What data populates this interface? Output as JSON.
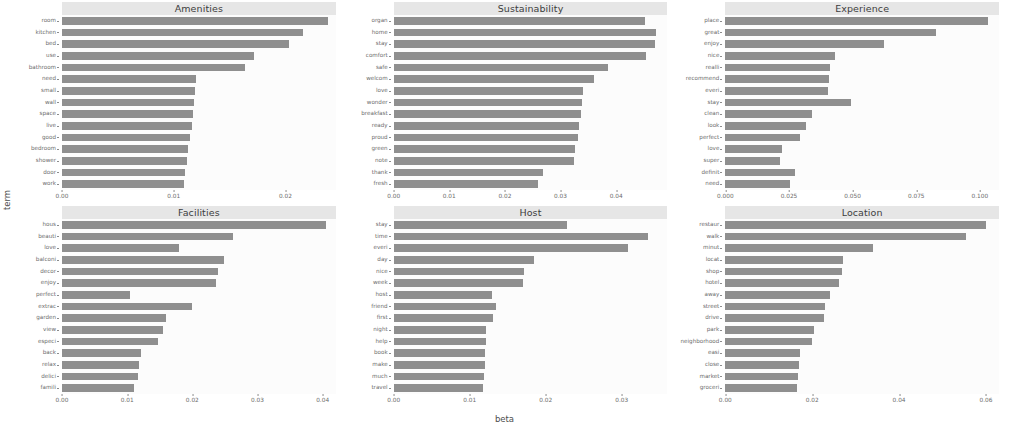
{
  "figure": {
    "xlabel": "beta",
    "ylabel": "term",
    "bar_color": "#8f8f8f",
    "strip_color": "#e6e6e6",
    "panel_color": "#fcfcfc"
  },
  "chart_data": [
    {
      "type": "bar",
      "title": "Amenities",
      "orientation": "horizontal",
      "xlabel": "beta",
      "ylabel": "term",
      "xlim": [
        0,
        0.0245
      ],
      "xticks": [
        0.0,
        0.01,
        0.02
      ],
      "xticklabels": [
        "0.00",
        "0.01",
        "0.02"
      ],
      "grid": false,
      "categories": [
        "room",
        "kitchen",
        "bed",
        "use",
        "bathroom",
        "need",
        "small",
        "wall",
        "space",
        "live",
        "good",
        "bedroom",
        "shower",
        "door",
        "work"
      ],
      "values": [
        0.0238,
        0.0216,
        0.0203,
        0.0172,
        0.0164,
        0.012,
        0.0119,
        0.0118,
        0.0117,
        0.0116,
        0.0115,
        0.0113,
        0.0112,
        0.011,
        0.0109
      ]
    },
    {
      "type": "bar",
      "title": "Sustainability",
      "orientation": "horizontal",
      "xlabel": "beta",
      "ylabel": "term",
      "xlim": [
        0,
        0.0492
      ],
      "xticks": [
        0.0,
        0.01,
        0.02,
        0.03,
        0.04
      ],
      "xticklabels": [
        "0.00",
        "0.01",
        "0.02",
        "0.03",
        "0.04"
      ],
      "grid": false,
      "categories": [
        "organ",
        "home",
        "stay",
        "comfort",
        "safe",
        "welcom",
        "love",
        "wonder",
        "breakfast",
        "ready",
        "proud",
        "green",
        "note",
        "thank",
        "fresh"
      ],
      "values": [
        0.0452,
        0.0472,
        0.047,
        0.0453,
        0.0386,
        0.0361,
        0.034,
        0.0338,
        0.0337,
        0.0334,
        0.0331,
        0.0326,
        0.0324,
        0.0268,
        0.026
      ]
    },
    {
      "type": "bar",
      "title": "Experience",
      "orientation": "horizontal",
      "xlabel": "beta",
      "ylabel": "term",
      "xlim": [
        0,
        0.1075
      ],
      "xticks": [
        0.0,
        0.025,
        0.05,
        0.075,
        0.1
      ],
      "xticklabels": [
        "0.000",
        "0.025",
        "0.050",
        "0.075",
        "0.100"
      ],
      "grid": false,
      "categories": [
        "place",
        "great",
        "enjoy",
        "nice",
        "realli",
        "recommend",
        "everi",
        "stay",
        "clean",
        "look",
        "perfect",
        "love",
        "super",
        "definit",
        "need"
      ],
      "values": [
        0.103,
        0.0828,
        0.0625,
        0.043,
        0.041,
        0.0408,
        0.0405,
        0.0495,
        0.034,
        0.0318,
        0.0295,
        0.0222,
        0.0215,
        0.0272,
        0.0255
      ]
    },
    {
      "type": "bar",
      "title": "Facilities",
      "orientation": "horizontal",
      "xlabel": "beta",
      "ylabel": "term",
      "xlim": [
        0,
        0.042
      ],
      "xticks": [
        0.0,
        0.01,
        0.02,
        0.03,
        0.04
      ],
      "xticklabels": [
        "0.00",
        "0.01",
        "0.02",
        "0.03",
        "0.04"
      ],
      "grid": false,
      "categories": [
        "hous",
        "beauti",
        "love",
        "balconi",
        "decor",
        "enjoy",
        "perfect",
        "extrac",
        "garden",
        "view",
        "especi",
        "back",
        "relax",
        "delici",
        "famili"
      ],
      "values": [
        0.0405,
        0.0262,
        0.018,
        0.0248,
        0.024,
        0.0236,
        0.0105,
        0.02,
        0.016,
        0.0155,
        0.0148,
        0.0122,
        0.0118,
        0.0117,
        0.011
      ]
    },
    {
      "type": "bar",
      "title": "Host",
      "orientation": "horizontal",
      "xlabel": "beta",
      "ylabel": "term",
      "xlim": [
        0,
        0.036
      ],
      "xticks": [
        0.0,
        0.01,
        0.02,
        0.03
      ],
      "xticklabels": [
        "0.00",
        "0.01",
        "0.02",
        "0.03"
      ],
      "grid": false,
      "categories": [
        "stay",
        "time",
        "everi",
        "day",
        "nice",
        "week",
        "host",
        "friend",
        "first",
        "night",
        "help",
        "book",
        "make",
        "much",
        "travel"
      ],
      "values": [
        0.0228,
        0.0334,
        0.0308,
        0.0185,
        0.0172,
        0.017,
        0.013,
        0.0134,
        0.0131,
        0.0122,
        0.0122,
        0.012,
        0.012,
        0.0119,
        0.0118
      ]
    },
    {
      "type": "bar",
      "title": "Location",
      "orientation": "horizontal",
      "xlabel": "beta",
      "ylabel": "term",
      "xlim": [
        0,
        0.063
      ],
      "xticks": [
        0.0,
        0.02,
        0.04,
        0.06
      ],
      "xticklabels": [
        "0.00",
        "0.02",
        "0.04",
        "0.06"
      ],
      "grid": false,
      "categories": [
        "restaur",
        "walk",
        "minut",
        "locat",
        "shop",
        "hotel",
        "away",
        "street",
        "drive",
        "park",
        "neighborhood",
        "easi",
        "close",
        "market",
        "groceri"
      ],
      "values": [
        0.06,
        0.0555,
        0.034,
        0.0272,
        0.0268,
        0.0262,
        0.0242,
        0.023,
        0.0228,
        0.0205,
        0.02,
        0.0172,
        0.017,
        0.0168,
        0.0166
      ]
    }
  ]
}
